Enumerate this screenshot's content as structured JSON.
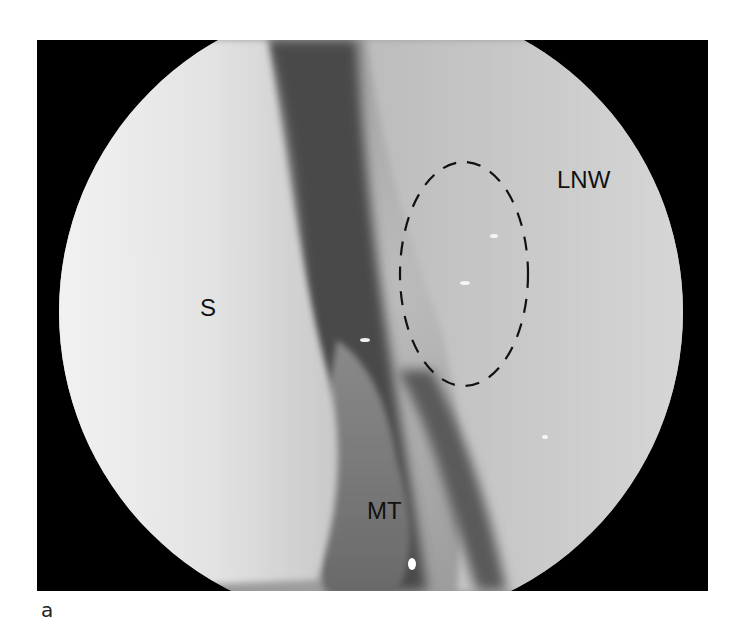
{
  "figure": {
    "panel_label": "a",
    "labels": {
      "septum": "S",
      "lateral_nasal_wall": "LNW",
      "middle_turbinate": "MT"
    },
    "annotation": "dashed-ellipse-region"
  }
}
